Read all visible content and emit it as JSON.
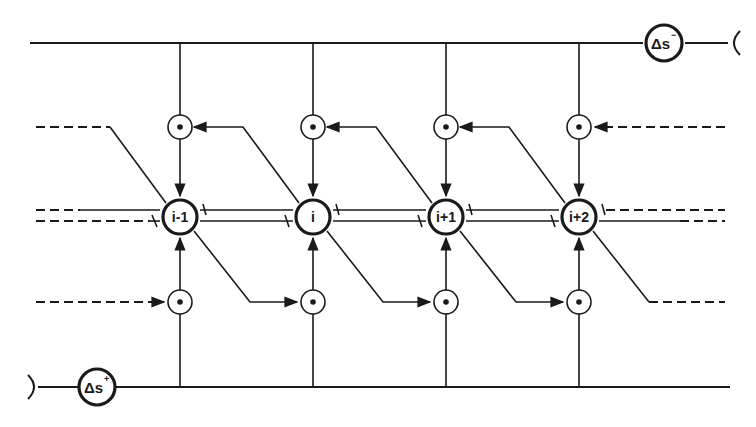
{
  "diagram": {
    "type": "staggered-grid-stencil",
    "colors": {
      "stroke": "#1a1a1a",
      "background": "#ffffff"
    },
    "boundary_labels": {
      "top": {
        "symbol": "Δs",
        "superscript": "−"
      },
      "bottom": {
        "symbol": "Δs",
        "superscript": "+"
      }
    },
    "nodes": [
      {
        "id": "n0",
        "label": "i-1"
      },
      {
        "id": "n1",
        "label": "i"
      },
      {
        "id": "n2",
        "label": "i+1"
      },
      {
        "id": "n3",
        "label": "i+2"
      }
    ],
    "upper_flux_points": 4,
    "lower_flux_points": 4
  }
}
